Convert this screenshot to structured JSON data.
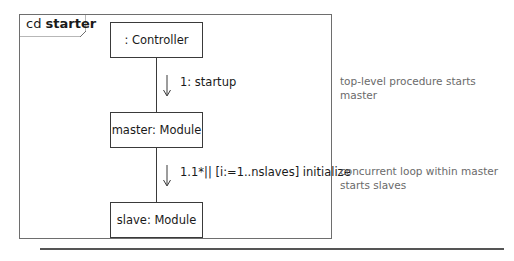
{
  "diagram": {
    "frame": {
      "kind": "cd",
      "name": "starter"
    },
    "objects": [
      {
        "id": "controller",
        "label": ": Controller"
      },
      {
        "id": "master",
        "label": "master: Module"
      },
      {
        "id": "slave",
        "label": "slave: Module"
      }
    ],
    "messages": [
      {
        "label": "1: startup",
        "from": "controller",
        "to": "master",
        "direction": "down"
      },
      {
        "label": "1.1*|| [i:=1..nslaves] initialize",
        "from": "master",
        "to": "slave",
        "direction": "down"
      }
    ],
    "notes": [
      {
        "lines": [
          "top-level procedure starts master"
        ]
      },
      {
        "lines": [
          "concurrent loop within master",
          "starts slaves"
        ]
      }
    ],
    "colors": {
      "line": "#3a3a3a",
      "frame": "#6e6e6e",
      "note_text": "#6a6a6a"
    }
  }
}
